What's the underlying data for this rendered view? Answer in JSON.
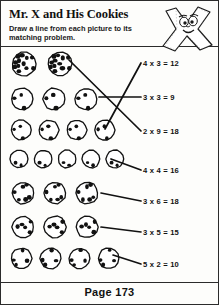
{
  "worksheet": {
    "title": "Mr. X and His Cookies",
    "instructions": "Draw a line from each picture to its matching problem.",
    "page_label": "Page 173",
    "mascot_name": "mr-x-character"
  },
  "cookie_groups": [
    {
      "id": "group-1",
      "count": 2,
      "chips_per_cookie": 12,
      "cookie_size": 26,
      "matches": "3 x 3 = 9"
    },
    {
      "id": "group-2",
      "count": 3,
      "chips_per_cookie": 3,
      "cookie_size": 24,
      "matches": "2 x 9 = 18"
    },
    {
      "id": "group-3",
      "count": 4,
      "chips_per_cookie": 3,
      "cookie_size": 22,
      "matches": "4 x 3 = 12"
    },
    {
      "id": "group-4",
      "count": 5,
      "chips_per_cookie": 2,
      "cookie_size": 20,
      "matches": "4 x 4 = 16"
    },
    {
      "id": "group-5",
      "count": 3,
      "chips_per_cookie": 6,
      "cookie_size": 24,
      "matches": "3 x 6 = 18"
    },
    {
      "id": "group-6",
      "count": 3,
      "chips_per_cookie": 5,
      "cookie_size": 24,
      "matches": "3 x 5 = 15"
    },
    {
      "id": "group-7",
      "count": 4,
      "chips_per_cookie": 4,
      "cookie_size": 23,
      "matches": "5 x 2 = 10"
    }
  ],
  "problems": [
    {
      "id": "problem-1",
      "text": "4 x 3 = 12"
    },
    {
      "id": "problem-2",
      "text": "3 x 3 = 9"
    },
    {
      "id": "problem-3",
      "text": "2 x 9 = 18"
    },
    {
      "id": "problem-4",
      "text": "4 x 4 = 16"
    },
    {
      "id": "problem-5",
      "text": "3 x 6 = 18"
    },
    {
      "id": "problem-6",
      "text": "3 x 5 = 15"
    },
    {
      "id": "problem-7",
      "text": "5 x 2 = 10"
    }
  ],
  "colors": {
    "ink": "#111111",
    "border": "#2b2b2b",
    "paper": "#fdfdfb"
  }
}
